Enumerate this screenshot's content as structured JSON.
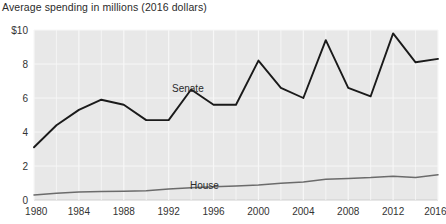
{
  "chart_data": {
    "type": "line",
    "title": "Average spending in millions (2016 dollars)",
    "xlabel": "",
    "ylabel": "",
    "xlim": [
      1980,
      2016
    ],
    "ylim": [
      0,
      10
    ],
    "grid": true,
    "legend_position": "inline-labels",
    "x": [
      1980,
      1982,
      1984,
      1986,
      1988,
      1990,
      1992,
      1994,
      1996,
      1998,
      2000,
      2002,
      2004,
      2006,
      2008,
      2010,
      2012,
      2014,
      2016
    ],
    "xticks": [
      "1980",
      "1984",
      "1988",
      "1992",
      "1996",
      "2000",
      "2004",
      "2008",
      "2012",
      "2016"
    ],
    "yticks": [
      "$10",
      "8",
      "6",
      "4",
      "2",
      "0"
    ],
    "series": [
      {
        "name": "Senate",
        "color": "#1a1a1a",
        "values": [
          3.1,
          4.4,
          5.3,
          5.9,
          5.6,
          4.7,
          4.7,
          6.5,
          5.6,
          5.6,
          8.2,
          6.6,
          6.0,
          9.4,
          6.6,
          6.1,
          9.8,
          8.1,
          8.3
        ]
      },
      {
        "name": "House",
        "color": "#6b6b6b",
        "values": [
          0.3,
          0.4,
          0.47,
          0.5,
          0.52,
          0.55,
          0.65,
          0.72,
          0.78,
          0.82,
          0.88,
          0.98,
          1.06,
          1.22,
          1.27,
          1.32,
          1.4,
          1.32,
          1.48
        ]
      }
    ],
    "annotations": [
      {
        "text": "Senate",
        "x": 1996,
        "y": 7.0
      },
      {
        "text": "House",
        "x": 1998,
        "y": 2.2
      }
    ]
  }
}
